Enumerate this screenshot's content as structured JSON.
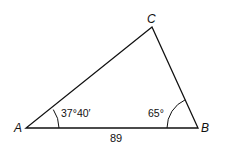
{
  "diagram": {
    "type": "triangle",
    "vertices": [
      {
        "label": "A",
        "x": 26,
        "y": 128
      },
      {
        "label": "B",
        "x": 198,
        "y": 128
      },
      {
        "label": "C",
        "x": 152,
        "y": 27
      }
    ],
    "angles": {
      "A": "37°40′",
      "B": "65°"
    },
    "sides": {
      "AB": "89"
    },
    "colors": {
      "stroke": "#111111",
      "background": "#ffffff"
    }
  }
}
